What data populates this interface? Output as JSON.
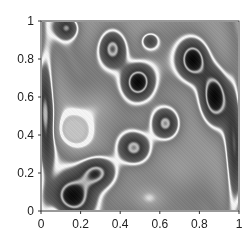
{
  "chart_data": {
    "type": "heatmap",
    "title": "",
    "xlabel": "",
    "ylabel": "",
    "xlim": [
      0,
      1
    ],
    "ylim": [
      0,
      1
    ],
    "grid": false,
    "legend": "none",
    "colormap": "grayscale with bright contour ridges",
    "xticks": [
      0,
      0.2,
      0.4,
      0.6,
      0.8,
      1
    ],
    "yticks": [
      0,
      0.2,
      0.4,
      0.6,
      0.8,
      1
    ],
    "xtick_labels": [
      "0",
      "0.2",
      "0.4",
      "0.6",
      "0.8",
      "1"
    ],
    "ytick_labels": [
      "0",
      "0.2",
      "0.4",
      "0.6",
      "0.8",
      "1"
    ],
    "dark_regions": [
      {
        "x": 0.36,
        "y": 0.86,
        "sx": 0.05,
        "sy": 0.07,
        "depth": 1.0
      },
      {
        "x": 0.49,
        "y": 0.68,
        "sx": 0.05,
        "sy": 0.06,
        "depth": 1.0
      },
      {
        "x": 0.63,
        "y": 0.46,
        "sx": 0.05,
        "sy": 0.06,
        "depth": 1.0
      },
      {
        "x": 0.47,
        "y": 0.33,
        "sx": 0.06,
        "sy": 0.06,
        "depth": 1.0
      },
      {
        "x": 0.28,
        "y": 0.2,
        "sx": 0.07,
        "sy": 0.06,
        "depth": 1.0
      },
      {
        "x": 0.15,
        "y": 0.07,
        "sx": 0.08,
        "sy": 0.07,
        "depth": 0.95
      },
      {
        "x": 0.77,
        "y": 0.8,
        "sx": 0.05,
        "sy": 0.07,
        "depth": 1.0
      },
      {
        "x": 0.88,
        "y": 0.6,
        "sx": 0.05,
        "sy": 0.1,
        "depth": 1.0
      },
      {
        "x": 0.13,
        "y": 0.97,
        "sx": 0.04,
        "sy": 0.04,
        "depth": 0.7
      },
      {
        "x": 0.55,
        "y": 0.9,
        "sx": 0.03,
        "sy": 0.03,
        "depth": 0.6
      },
      {
        "x": 0.02,
        "y": 0.5,
        "sx": 0.03,
        "sy": 0.3,
        "depth": 0.7
      },
      {
        "x": 0.98,
        "y": 0.3,
        "sx": 0.03,
        "sy": 0.3,
        "depth": 0.6
      }
    ],
    "light_regions": [
      {
        "x": 0.16,
        "y": 0.42,
        "sx": 0.07,
        "sy": 0.06,
        "height": 0.8
      },
      {
        "x": 0.28,
        "y": 0.55,
        "sx": 0.08,
        "sy": 0.07,
        "height": 0.5
      },
      {
        "x": 0.55,
        "y": 0.06,
        "sx": 0.06,
        "sy": 0.05,
        "height": 0.6
      },
      {
        "x": 0.7,
        "y": 0.2,
        "sx": 0.08,
        "sy": 0.08,
        "height": 0.4
      }
    ]
  }
}
